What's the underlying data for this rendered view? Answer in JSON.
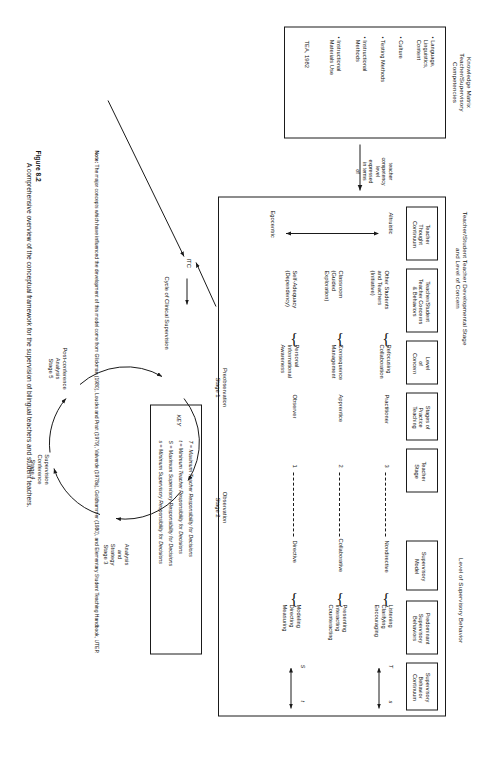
{
  "figure": {
    "caption_bold": "Figure 8.2",
    "caption_text": "A comprehensive overview of the conceptual framework for the supervision of bilingual teachers and student teachers."
  },
  "note": {
    "label": "Note:",
    "text": "The major concepts which have influenced the development of this model come from Glickman (1980), Loucks and Pratt (1979), Valverde (1978a), Goldhammer (1980), and Elementary Student Teaching Handbook, UTEP."
  },
  "headers": {
    "knowledge_matrix": "Knowledge Matrix\nTeacher/Supervisory\nCompetencies",
    "developmental_stage": "Teacher/Student Teacher Developmental Stage\nand Level of Concern",
    "supervisory_behavior": "Level of Supervisory Behavior"
  },
  "knowledge_matrix": {
    "items": [
      "• Language,\n  Linguistics,\n  Content",
      "• Culture",
      "• Testing Methods",
      "• Instructional\n  Methods",
      "• Instructional\n  Materials Use"
    ],
    "source": "TEA, 1982"
  },
  "bridge_label": "teacher\ncompetency\nlevel\nexpressed\nin terms\nof",
  "columns": {
    "teacher_thought": "Teacher\nThought\nContinuum",
    "concerns_behaviors": "Teacher/Student\nTeacher Concerns\n& Behaviors",
    "level_of_concern": "Level\nof\nConcern",
    "stages_of_practice": "Stages of\nPractice\nTeaching",
    "teacher_stage": "Teacher\nStage",
    "supervisory_model": "Supervisory\nModel",
    "predominant_behaviors": "Predominant\nSupervisory\nBehaviors",
    "behavior_continuum": "Supervisory\nBehavior\nContinuum"
  },
  "continuum": {
    "top": "Altruistic",
    "bottom": "Egocentric"
  },
  "rows": [
    {
      "concern_behavior": "Other Students\nand Teachers\n(Initiative)",
      "level_of_concern": "Refocusing\nCollaboration",
      "stage_of_practice": "Practitioner",
      "teacher_stage": "3",
      "supervisory_model": "Nondirective",
      "behaviors": "Listening\nClarifying\nEncouraging"
    },
    {
      "concern_behavior": "Classroom\n(Guided\nExploration)",
      "level_of_concern": "Consequence\nManagement",
      "stage_of_practice": "Apprentice",
      "teacher_stage": "2",
      "supervisory_model": "Collaborative",
      "behaviors": "Presenting\nInteracting\nCounteracting"
    },
    {
      "concern_behavior": "Self-Adequacy\n(Dependency)",
      "level_of_concern": "Personal\nInformational\nAwareness",
      "stage_of_practice": "Observer",
      "teacher_stage": "1",
      "supervisory_model": "Directive",
      "behaviors": "Modeling\nDirecting\nMeasuring"
    }
  ],
  "continuum_markers": {
    "top_left": "T",
    "top_right": "s",
    "bottom_left": "S",
    "bottom_right": "t"
  },
  "key": {
    "title": "KEY",
    "entries": [
      "T = Maximum Teacher Responsibility for Decisions",
      "t = Minimum Teacher Responsibility for Decisions",
      "S = Maximum Supervisory Responsibility for Decisions",
      "s = Minimum Supervisory Responsibility for Decisions"
    ]
  },
  "itc_label": "ITC",
  "cycle": {
    "title": "Cycle of Clinical Supervision",
    "stages": [
      "Preobservation\nStage 1",
      "Observation\nStage 2",
      "Analysis\nand\nStrategy\nStage 3",
      "Supervision\nConference\nStage 4",
      "Post-conference\nAnalysis\nStage 5"
    ]
  }
}
